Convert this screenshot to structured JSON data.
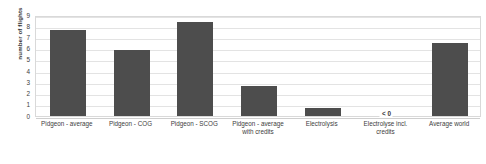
{
  "chart_data": {
    "type": "bar",
    "title": "",
    "xlabel": "",
    "ylabel": "number of flights",
    "ylim": [
      0,
      9
    ],
    "yticks": [
      9,
      8,
      7,
      6,
      5,
      4,
      3,
      2,
      1,
      0
    ],
    "grid": true,
    "legend": "none",
    "bar_color": "#4d4d4d",
    "categories": [
      "Pidgeon - average",
      "Pidgeon - COG",
      "Pidgeon - SCOG",
      "Pidgeon - average with credits",
      "Electrolysis",
      "Electrolyse incl. credits",
      "Average world"
    ],
    "values": [
      7.6,
      5.8,
      8.35,
      2.6,
      0.7,
      null,
      6.5
    ],
    "annotations": [
      {
        "category": "Electrolyse incl. credits",
        "text": "< 0",
        "note": "value below zero, no bar drawn"
      }
    ]
  },
  "axis": {
    "y_title": "number of flights",
    "tick_labels": [
      "9",
      "8",
      "7",
      "6",
      "5",
      "4",
      "3",
      "2",
      "1",
      "0"
    ]
  },
  "x_axis_labels": [
    {
      "line1": "Pidgeon - average",
      "line2": ""
    },
    {
      "line1": "Pidgeon - COG",
      "line2": ""
    },
    {
      "line1": "Pidgeon - SCOG",
      "line2": ""
    },
    {
      "line1": "Pidgeon - average",
      "line2": "with credits"
    },
    {
      "line1": "Electrolysis",
      "line2": ""
    },
    {
      "line1": "Electrolyse incl.",
      "line2": "credits"
    },
    {
      "line1": "Average world",
      "line2": ""
    }
  ],
  "below_zero_label": "< 0"
}
